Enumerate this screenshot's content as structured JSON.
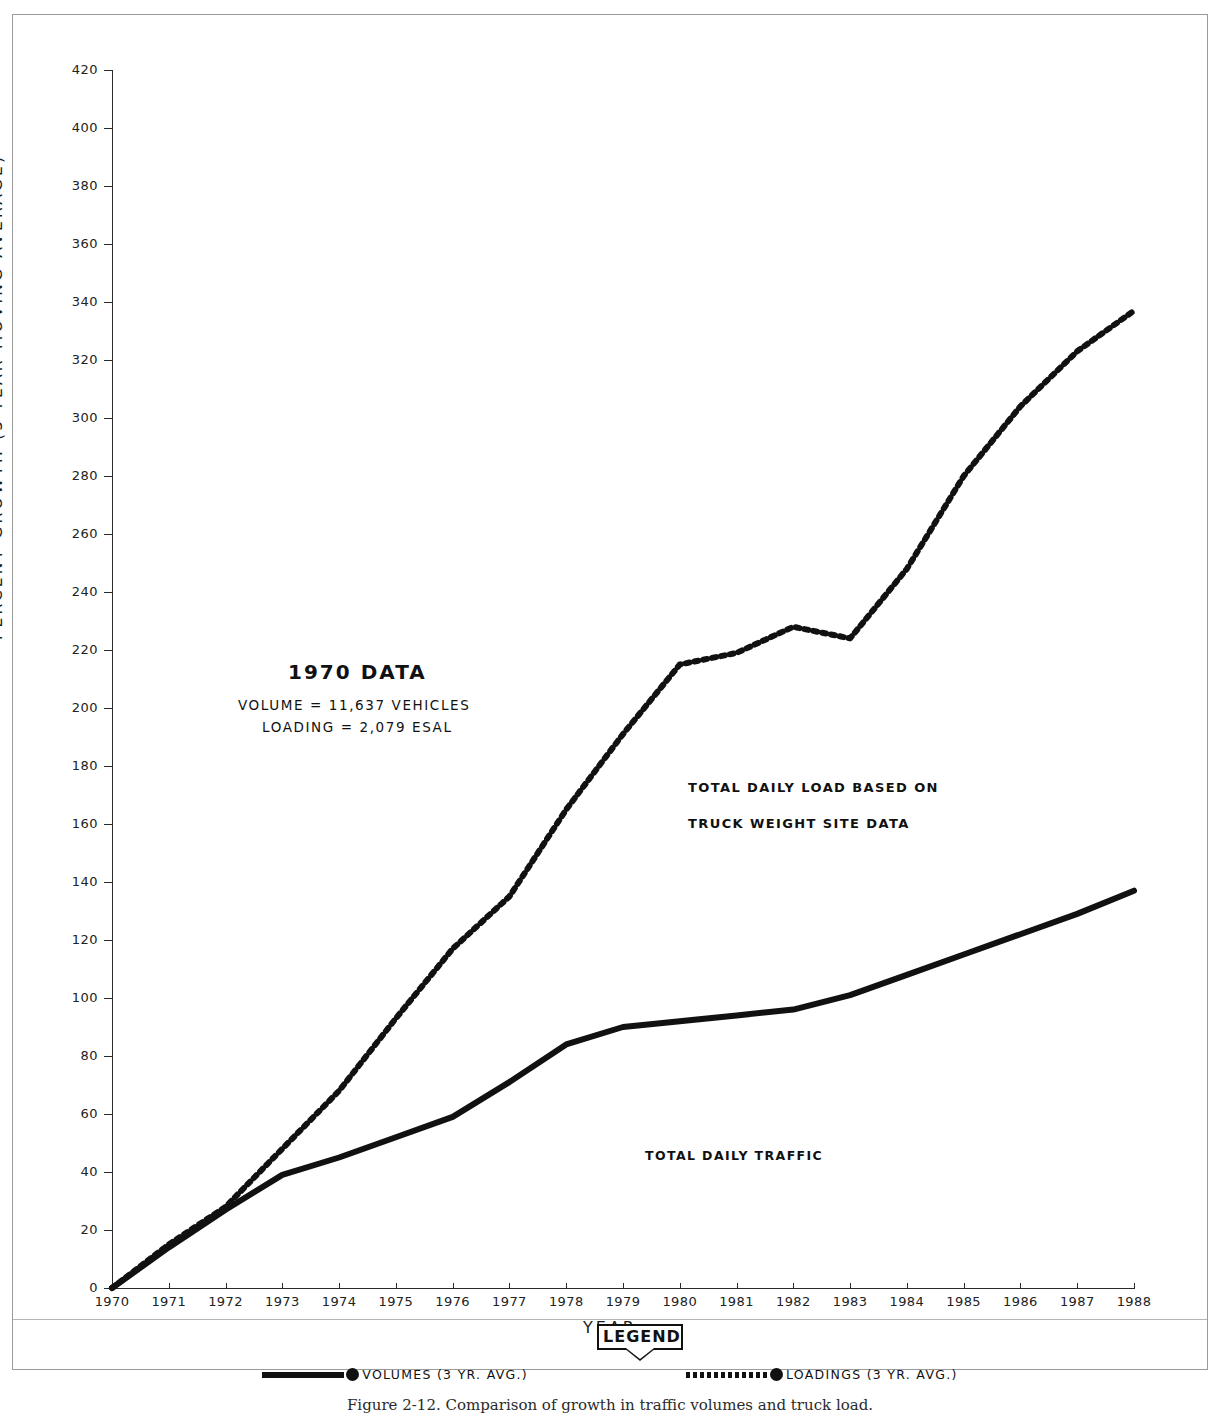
{
  "chart_data": {
    "type": "line",
    "title": "",
    "xlabel": "YEAR",
    "ylabel": "PERCENT GROWTH (3-YEAR MOVING AVERAGE)",
    "xlim": [
      1970,
      1988
    ],
    "ylim": [
      0,
      420
    ],
    "y_ticks": [
      0,
      20,
      40,
      60,
      80,
      100,
      120,
      140,
      160,
      180,
      200,
      220,
      240,
      260,
      280,
      300,
      320,
      340,
      360,
      380,
      400,
      420
    ],
    "x_ticks": [
      1970,
      1971,
      1972,
      1973,
      1974,
      1975,
      1976,
      1977,
      1978,
      1979,
      1980,
      1981,
      1982,
      1983,
      1984,
      1985,
      1986,
      1987,
      1988
    ],
    "grid": false,
    "legend_position": "bottom",
    "x": [
      1970,
      1971,
      1972,
      1973,
      1974,
      1975,
      1976,
      1977,
      1978,
      1979,
      1980,
      1981,
      1982,
      1983,
      1984,
      1985,
      1986,
      1987,
      1988
    ],
    "series": [
      {
        "name": "VOLUMES (3 YR. AVG.)",
        "style": "solid",
        "color": "#111111",
        "values": [
          0,
          14,
          27,
          39,
          45,
          52,
          59,
          71,
          84,
          90,
          92,
          94,
          96,
          101,
          108,
          115,
          122,
          129,
          137
        ]
      },
      {
        "name": "LOADINGS (3 YR. AVG.)",
        "style": "dotted",
        "color": "#111111",
        "values": [
          0,
          15,
          28,
          48,
          68,
          93,
          117,
          135,
          165,
          191,
          215,
          219,
          228,
          224,
          248,
          280,
          304,
          323,
          337
        ]
      }
    ],
    "annotations": [
      {
        "name": "1970-data-title",
        "text": "1970 DATA"
      },
      {
        "name": "1970-volume",
        "text": "VOLUME = 11,637 VEHICLES"
      },
      {
        "name": "1970-loading",
        "text": "LOADING = 2,079 ESAL"
      },
      {
        "name": "loadings-label-line1",
        "text": "TOTAL DAILY LOAD BASED ON"
      },
      {
        "name": "loadings-label-line2",
        "text": "TRUCK WEIGHT SITE DATA"
      },
      {
        "name": "volumes-label",
        "text": "TOTAL DAILY TRAFFIC"
      }
    ]
  },
  "annotations": {
    "data_title": "1970 DATA",
    "volume_line": "VOLUME = 11,637 VEHICLES",
    "loading_line": "LOADING = 2,079 ESAL",
    "load_label_1": "TOTAL DAILY LOAD BASED ON",
    "load_label_2": "TRUCK WEIGHT SITE DATA",
    "traffic_label": "TOTAL DAILY TRAFFIC"
  },
  "axes": {
    "x_title": "YEAR",
    "y_title": "PERCENT GROWTH (3-YEAR MOVING AVERAGE)"
  },
  "legend": {
    "title": "LEGEND",
    "entries": [
      {
        "label": "VOLUMES (3 YR. AVG.)",
        "style": "solid"
      },
      {
        "label": "LOADINGS (3 YR. AVG.)",
        "style": "dotted"
      }
    ]
  },
  "caption": {
    "text": "Figure 2-12.  Comparison of growth in traffic volumes and truck load."
  }
}
